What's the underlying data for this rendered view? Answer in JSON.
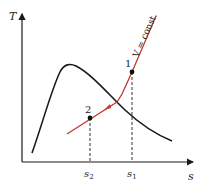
{
  "diagram": {
    "axes": {
      "y_label": "T",
      "x_label": "s"
    },
    "curves": {
      "saturation_dome": {
        "color": "#1a1a1a"
      },
      "process_line": {
        "label": "V = const.",
        "color": "#c0392b"
      }
    },
    "points": [
      {
        "id": "1",
        "label": "1",
        "x_tick": "s",
        "x_tick_sub": "1"
      },
      {
        "id": "2",
        "label": "2",
        "x_tick": "s",
        "x_tick_sub": "2"
      }
    ],
    "colors": {
      "axis": "#1a1a1a",
      "dome": "#1a1a1a",
      "process": "#c0392b",
      "dashed": "#333333"
    }
  }
}
